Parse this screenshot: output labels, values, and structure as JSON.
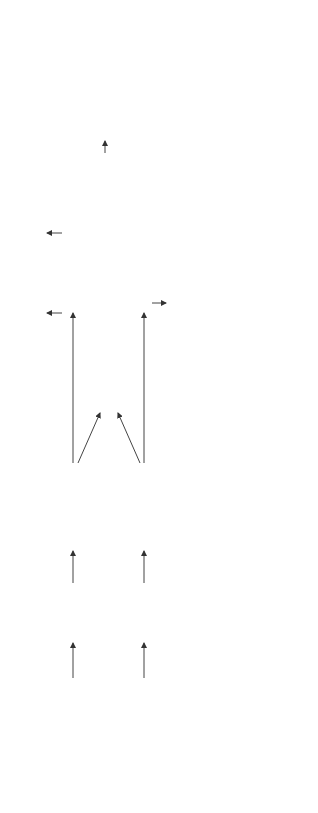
{
  "main": {
    "transcript_text": [
      "[CLS] toast the [MASK]",
      "[MASK] in the toaster [SEP]"
    ],
    "transcript_label": "Transcript",
    "video_label": "Video Clip",
    "text_encoder": {
      "title": "Text Encoder",
      "subtitle": "( Transformer Encoder )"
    },
    "video_encoder": {
      "title": "Video Encoder",
      "subtitle": "( Transformer Encoder )"
    },
    "joint_label": "Joint",
    "joint_value": "0/1",
    "cross_encoder": {
      "title": "Cross Encoder",
      "subtitle": "( Transformer Encoder )"
    },
    "decoder": {
      "title": "Decoder",
      "subtitle": "( Transformer Decoder )"
    },
    "alignment_label": "Alignment",
    "alignment_value": "0/1",
    "cmlm_label": "CMLM",
    "cmlm_words": [
      "bread",
      "slices"
    ],
    "cmfm_label": "CMFM",
    "masked_feature_label": "masked feature",
    "generation_label": "Generation",
    "generation_text": [
      "toast the bread slices",
      "in the toaster [SEP]"
    ],
    "text_token_colors": [
      "#9a9a9a",
      "#a8a8a8",
      "#b0b0b0",
      "#c8c8c8",
      "#d0d0d0",
      "#9e9e9e",
      "#a4a4a4",
      "#b4b4b4",
      "#9a9a9a"
    ],
    "video_token_colors": [
      "#9a9a9a",
      "#d0d0d0",
      "#8e8e8e",
      "#d4d4d4",
      "#9a9a9a"
    ]
  },
  "panels": {
    "retrieval": {
      "title": "Retrieval",
      "input_text": [
        "[CLS] peanuts",
        "and..."
      ],
      "text_tag": "Text",
      "video_tag": "Video Clip",
      "text_encoder": "Text Encoder",
      "video_encoder": "Video Encoder",
      "joint_label": "Joint",
      "joint_value": "0.12",
      "cross_encoder": "Cross Encoder",
      "alignment_label": "Alignment",
      "alignment_value": "0.12"
    },
    "caption": {
      "title": "Caption",
      "input_text": [
        "[CLS] you",
        "specially..."
      ],
      "text_tag": "Transcript",
      "video_tag": "Video Clip",
      "text_encoder": "Text Encoder",
      "video_encoder": "Video Encoder",
      "cross_encoder": "Cross Encoder",
      "decoder": "Decoder",
      "output_text": [
        "place the",
        "bacon",
        "slices..."
      ]
    },
    "action": {
      "title": "Action Tasks",
      "subtitle": "segmentation & step localization",
      "input_text": "[CLS] pour juice",
      "text_tag": "Step Description",
      "video_tag": "Video Clip",
      "text_encoder": "Text Encoder",
      "video_encoder": "Video Encoder"
    },
    "classification": {
      "title": "Multimodal Classification",
      "input_text": [
        "[CLS] you",
        "specially..."
      ],
      "text_tag": "Transcript",
      "video_tag": "Video Clip",
      "text_encoder": "Text Encoder",
      "video_encoder": "Video Encoder",
      "cross_encoder": "Cross Encoder"
    }
  }
}
